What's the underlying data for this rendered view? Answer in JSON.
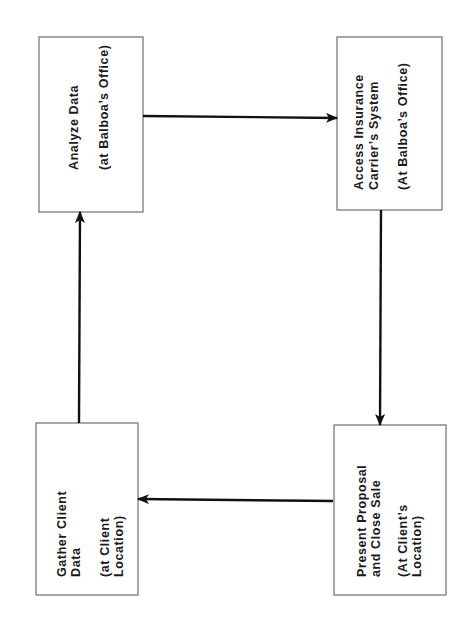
{
  "diagram": {
    "type": "process-cycle",
    "orientation": "rotated-90-ccw",
    "colors": {
      "box_border": "#7a7a7a",
      "arrow": "#111111",
      "text": "#1a1a1a",
      "background": "#ffffff"
    },
    "nodes": [
      {
        "id": "analyze",
        "position": "top-left",
        "lines": [
          "Analyze Data",
          "",
          "(at Balboa’s Office)"
        ]
      },
      {
        "id": "access",
        "position": "top-right",
        "lines": [
          "Access Insurance",
          "Carrier’s System",
          "",
          "(At Balboa’s Office)"
        ]
      },
      {
        "id": "present",
        "position": "bottom-right",
        "lines": [
          "Present Proposal",
          "and Close Sale",
          "",
          "(At Client’s",
          "Location)"
        ]
      },
      {
        "id": "gather",
        "position": "bottom-left",
        "lines": [
          "Gather Client",
          "Data",
          "",
          "(at Client",
          "Location)"
        ]
      }
    ],
    "edges": [
      {
        "from": "analyze",
        "to": "access"
      },
      {
        "from": "access",
        "to": "present"
      },
      {
        "from": "present",
        "to": "gather"
      },
      {
        "from": "gather",
        "to": "analyze"
      }
    ]
  }
}
